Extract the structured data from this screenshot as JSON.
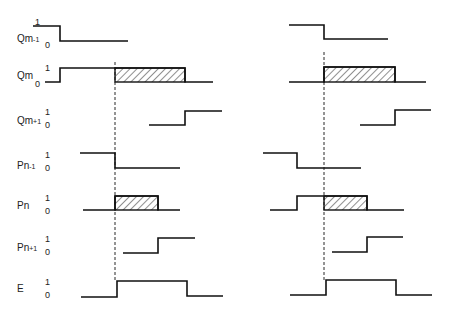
{
  "diagram": {
    "type": "timing-diagram",
    "panels": 2,
    "level_labels": {
      "high": "1",
      "low": "0"
    },
    "signals": [
      {
        "id": "qm_minus_1",
        "name": "Qm",
        "sub": "-1",
        "label_y": 34,
        "one_y": 18,
        "zero_y": 41
      },
      {
        "id": "qm",
        "name": "Qm",
        "sub": "",
        "label_y": 71,
        "one_y": 64,
        "zero_y": 80
      },
      {
        "id": "qm_plus_1",
        "name": "Qm",
        "sub": "+1",
        "label_y": 116,
        "one_y": 108,
        "zero_y": 121
      },
      {
        "id": "pn_minus_1",
        "name": "Pn",
        "sub": "-1",
        "label_y": 161,
        "one_y": 151,
        "zero_y": 164
      },
      {
        "id": "pn",
        "name": "Pn",
        "sub": "",
        "label_y": 201,
        "one_y": 194,
        "zero_y": 207
      },
      {
        "id": "pn_plus_1",
        "name": "Pn",
        "sub": "+1",
        "label_y": 243,
        "one_y": 235,
        "zero_y": 248
      },
      {
        "id": "e",
        "name": "E",
        "sub": "",
        "label_y": 284,
        "one_y": 278,
        "zero_y": 291
      }
    ],
    "left_panel": {
      "dashed_line": {
        "x": 115,
        "y1": 62,
        "y2": 282
      },
      "waveforms": [
        {
          "signal": "qm_minus_1",
          "points": [
            [
              33,
              26
            ],
            [
              60,
              26
            ],
            [
              60,
              41
            ],
            [
              128,
              41
            ]
          ]
        },
        {
          "signal": "qm",
          "points": [
            [
              45,
              82
            ],
            [
              60,
              82
            ],
            [
              60,
              68
            ],
            [
              185,
              68
            ],
            [
              185,
              82
            ],
            [
              213,
              82
            ]
          ],
          "hatch": [
            115,
            68,
            185,
            82
          ]
        },
        {
          "signal": "qm_plus_1",
          "points": [
            [
              149,
              125
            ],
            [
              185,
              125
            ],
            [
              185,
              111
            ],
            [
              222,
              111
            ]
          ]
        },
        {
          "signal": "pn_minus_1",
          "points": [
            [
              80,
              153
            ],
            [
              115,
              153
            ],
            [
              115,
              168
            ],
            [
              180,
              168
            ]
          ]
        },
        {
          "signal": "pn",
          "points": [
            [
              83,
              210
            ],
            [
              115,
              210
            ],
            [
              115,
              196
            ],
            [
              158,
              196
            ],
            [
              158,
              210
            ],
            [
              180,
              210
            ]
          ],
          "hatch": [
            115,
            196,
            158,
            210
          ]
        },
        {
          "signal": "pn_plus_1",
          "points": [
            [
              123,
              253
            ],
            [
              158,
              253
            ],
            [
              158,
              238
            ],
            [
              195,
              238
            ]
          ]
        },
        {
          "signal": "e",
          "points": [
            [
              81,
              297
            ],
            [
              117,
              297
            ],
            [
              117,
              281
            ],
            [
              187,
              281
            ],
            [
              187,
              296
            ],
            [
              223,
              296
            ]
          ]
        }
      ]
    },
    "right_panel": {
      "dashed_line": {
        "x": 324,
        "y1": 52,
        "y2": 280
      },
      "waveforms": [
        {
          "signal": "qm_minus_1",
          "points": [
            [
              289,
              25
            ],
            [
              324,
              25
            ],
            [
              324,
              39
            ],
            [
              388,
              39
            ]
          ]
        },
        {
          "signal": "qm",
          "points": [
            [
              289,
              82
            ],
            [
              324,
              82
            ],
            [
              324,
              67
            ],
            [
              395,
              67
            ],
            [
              395,
              82
            ],
            [
              426,
              82
            ]
          ],
          "hatch": [
            324,
            67,
            395,
            82
          ]
        },
        {
          "signal": "qm_plus_1",
          "points": [
            [
              360,
              125
            ],
            [
              395,
              125
            ],
            [
              395,
              110
            ],
            [
              431,
              110
            ]
          ]
        },
        {
          "signal": "pn_minus_1",
          "points": [
            [
              263,
              153
            ],
            [
              297,
              153
            ],
            [
              297,
              168
            ],
            [
              361,
              168
            ]
          ]
        },
        {
          "signal": "pn",
          "points": [
            [
              270,
              210
            ],
            [
              297,
              210
            ],
            [
              297,
              196
            ],
            [
              367,
              196
            ],
            [
              367,
              210
            ],
            [
              404,
              210
            ]
          ],
          "hatch": [
            324,
            196,
            367,
            210
          ]
        },
        {
          "signal": "pn_plus_1",
          "points": [
            [
              332,
              252
            ],
            [
              367,
              252
            ],
            [
              367,
              237
            ],
            [
              403,
              237
            ]
          ]
        },
        {
          "signal": "e",
          "points": [
            [
              290,
              295
            ],
            [
              326,
              295
            ],
            [
              326,
              280
            ],
            [
              396,
              280
            ],
            [
              396,
              295
            ],
            [
              432,
              295
            ]
          ]
        }
      ]
    },
    "colors": {
      "line": "#111111",
      "hatch": "#222222",
      "background": "#ffffff"
    }
  }
}
